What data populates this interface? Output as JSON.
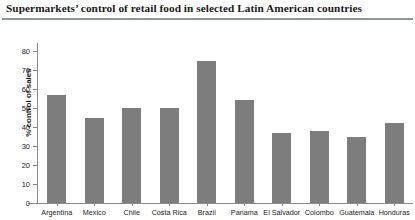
{
  "chart_data": {
    "type": "bar",
    "title": "Supermarkets’ control of retail food in selected Latin American countries",
    "xlabel": "",
    "ylabel": "% control of sales",
    "categories": [
      "Argentina",
      "Mexico",
      "Chile",
      "Costa Rica",
      "Brazil",
      "Panama",
      "El Salvador",
      "Colombo",
      "Guatemala",
      "Honduras"
    ],
    "values": [
      57,
      45,
      50,
      50,
      75,
      54,
      37,
      38,
      35,
      42
    ],
    "ylim": [
      0,
      80
    ],
    "yticks": [
      0,
      10,
      20,
      30,
      40,
      50,
      60,
      70,
      80
    ],
    "ytick_labels": [
      "0",
      "10",
      "20",
      "30",
      "40",
      "50",
      "60",
      "70",
      "80"
    ],
    "grid": false,
    "legend": false,
    "bar_color": "#7d7d7d",
    "axis_color": "#8a8a8a",
    "rule_color": "#8e95a3",
    "text_color": "#1b1b1b",
    "background": "#ffffff"
  }
}
